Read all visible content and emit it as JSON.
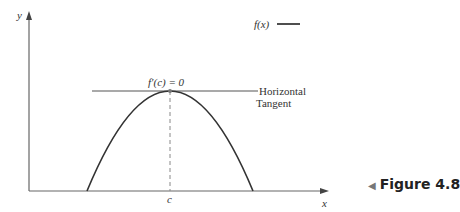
{
  "diagram": {
    "axis_labels": {
      "y": "y",
      "x": "x"
    },
    "legend": {
      "label": "f(x)"
    },
    "annotation_top": "f′(c) = 0",
    "tangent_label_line1": "Horizontal",
    "tangent_label_line2": "Tangent",
    "c_label": "c",
    "figure_caption": "Figure 4.8",
    "colors": {
      "axis": "#555555",
      "curve": "#333333",
      "text": "#333333"
    }
  }
}
